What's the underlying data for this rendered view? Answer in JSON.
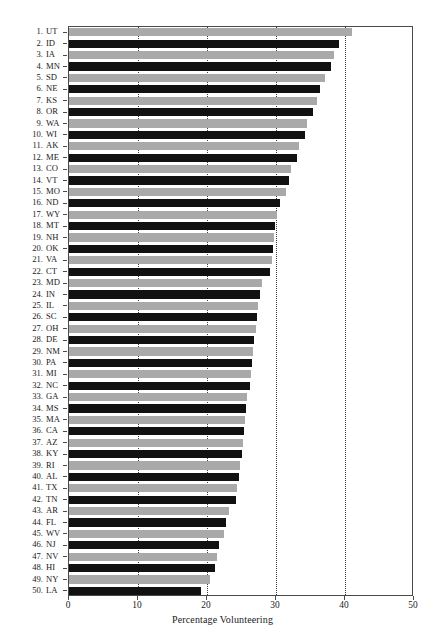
{
  "chart_data": {
    "type": "bar",
    "orientation": "horizontal",
    "title": "",
    "xlabel": "Percentage Volunteering",
    "ylabel": "",
    "xlim": [
      0,
      50
    ],
    "ylim": [
      0,
      50
    ],
    "xticks": [
      0,
      10,
      20,
      30,
      40,
      50
    ],
    "xticklabels": [
      "0",
      "10",
      "20",
      "30",
      "40",
      "50"
    ],
    "grid": "vertical dotted gridlines at 10, 20, 30, 40",
    "legend": "none",
    "bar_colors": [
      "#a9a9a9",
      "#111111"
    ],
    "bar_color_pattern": "alternating light gray / black by rank",
    "categories": [
      "UT",
      "ID",
      "IA",
      "MN",
      "SD",
      "NE",
      "KS",
      "OR",
      "WA",
      "WI",
      "AK",
      "ME",
      "CO",
      "VT",
      "MO",
      "ND",
      "WY",
      "MT",
      "NH",
      "OK",
      "VA",
      "CT",
      "MD",
      "IN",
      "IL",
      "SC",
      "OH",
      "DE",
      "NM",
      "PA",
      "MI",
      "NC",
      "GA",
      "MS",
      "MA",
      "CA",
      "AZ",
      "KY",
      "RI",
      "AL",
      "TX",
      "TN",
      "AR",
      "FL",
      "WV",
      "NJ",
      "NV",
      "HI",
      "NY",
      "LA"
    ],
    "ranks": [
      1,
      2,
      3,
      4,
      5,
      6,
      7,
      8,
      9,
      10,
      11,
      12,
      13,
      14,
      15,
      16,
      17,
      18,
      19,
      20,
      21,
      22,
      23,
      24,
      25,
      26,
      27,
      28,
      29,
      30,
      31,
      32,
      33,
      34,
      35,
      36,
      37,
      38,
      39,
      40,
      41,
      42,
      43,
      44,
      45,
      46,
      47,
      48,
      49,
      50
    ],
    "values": [
      41.0,
      39.1,
      38.4,
      38.0,
      37.1,
      36.4,
      36.0,
      35.4,
      34.5,
      34.2,
      33.3,
      33.1,
      32.2,
      31.9,
      31.4,
      30.6,
      30.2,
      29.9,
      29.7,
      29.6,
      29.4,
      29.2,
      28.0,
      27.7,
      27.4,
      27.2,
      27.1,
      26.8,
      26.7,
      26.5,
      26.4,
      26.3,
      25.8,
      25.6,
      25.5,
      25.3,
      25.2,
      25.1,
      24.8,
      24.6,
      24.3,
      24.2,
      23.2,
      22.8,
      22.5,
      21.8,
      21.4,
      21.2,
      20.4,
      19.1
    ],
    "rows": [
      {
        "rank": "1.",
        "abbr": "UT",
        "value": 41.0,
        "color": "light"
      },
      {
        "rank": "2.",
        "abbr": "ID",
        "value": 39.1,
        "color": "dark"
      },
      {
        "rank": "3.",
        "abbr": "IA",
        "value": 38.4,
        "color": "light"
      },
      {
        "rank": "4.",
        "abbr": "MN",
        "value": 38.0,
        "color": "dark"
      },
      {
        "rank": "5.",
        "abbr": "SD",
        "value": 37.1,
        "color": "light"
      },
      {
        "rank": "6.",
        "abbr": "NE",
        "value": 36.4,
        "color": "dark"
      },
      {
        "rank": "7.",
        "abbr": "KS",
        "value": 36.0,
        "color": "light"
      },
      {
        "rank": "8.",
        "abbr": "OR",
        "value": 35.4,
        "color": "dark"
      },
      {
        "rank": "9.",
        "abbr": "WA",
        "value": 34.5,
        "color": "light"
      },
      {
        "rank": "10.",
        "abbr": "WI",
        "value": 34.2,
        "color": "dark"
      },
      {
        "rank": "11.",
        "abbr": "AK",
        "value": 33.3,
        "color": "light"
      },
      {
        "rank": "12.",
        "abbr": "ME",
        "value": 33.1,
        "color": "dark"
      },
      {
        "rank": "13.",
        "abbr": "CO",
        "value": 32.2,
        "color": "light"
      },
      {
        "rank": "14.",
        "abbr": "VT",
        "value": 31.9,
        "color": "dark"
      },
      {
        "rank": "15.",
        "abbr": "MO",
        "value": 31.4,
        "color": "light"
      },
      {
        "rank": "16.",
        "abbr": "ND",
        "value": 30.6,
        "color": "dark"
      },
      {
        "rank": "17.",
        "abbr": "WY",
        "value": 30.2,
        "color": "light"
      },
      {
        "rank": "18.",
        "abbr": "MT",
        "value": 29.9,
        "color": "dark"
      },
      {
        "rank": "19.",
        "abbr": "NH",
        "value": 29.7,
        "color": "light"
      },
      {
        "rank": "20.",
        "abbr": "OK",
        "value": 29.6,
        "color": "dark"
      },
      {
        "rank": "21.",
        "abbr": "VA",
        "value": 29.4,
        "color": "light"
      },
      {
        "rank": "22.",
        "abbr": "CT",
        "value": 29.2,
        "color": "dark"
      },
      {
        "rank": "23.",
        "abbr": "MD",
        "value": 28.0,
        "color": "light"
      },
      {
        "rank": "24.",
        "abbr": "IN",
        "value": 27.7,
        "color": "dark"
      },
      {
        "rank": "25.",
        "abbr": "IL",
        "value": 27.4,
        "color": "light"
      },
      {
        "rank": "26.",
        "abbr": "SC",
        "value": 27.2,
        "color": "dark"
      },
      {
        "rank": "27.",
        "abbr": "OH",
        "value": 27.1,
        "color": "light"
      },
      {
        "rank": "28.",
        "abbr": "DE",
        "value": 26.8,
        "color": "dark"
      },
      {
        "rank": "29.",
        "abbr": "NM",
        "value": 26.7,
        "color": "light"
      },
      {
        "rank": "30.",
        "abbr": "PA",
        "value": 26.5,
        "color": "dark"
      },
      {
        "rank": "31.",
        "abbr": "MI",
        "value": 26.4,
        "color": "light"
      },
      {
        "rank": "32.",
        "abbr": "NC",
        "value": 26.3,
        "color": "dark"
      },
      {
        "rank": "33.",
        "abbr": "GA",
        "value": 25.8,
        "color": "light"
      },
      {
        "rank": "34.",
        "abbr": "MS",
        "value": 25.6,
        "color": "dark"
      },
      {
        "rank": "35.",
        "abbr": "MA",
        "value": 25.5,
        "color": "light"
      },
      {
        "rank": "36.",
        "abbr": "CA",
        "value": 25.3,
        "color": "dark"
      },
      {
        "rank": "37.",
        "abbr": "AZ",
        "value": 25.2,
        "color": "light"
      },
      {
        "rank": "38.",
        "abbr": "KY",
        "value": 25.1,
        "color": "dark"
      },
      {
        "rank": "39.",
        "abbr": "RI",
        "value": 24.8,
        "color": "light"
      },
      {
        "rank": "40.",
        "abbr": "AL",
        "value": 24.6,
        "color": "dark"
      },
      {
        "rank": "41.",
        "abbr": "TX",
        "value": 24.3,
        "color": "light"
      },
      {
        "rank": "42.",
        "abbr": "TN",
        "value": 24.2,
        "color": "dark"
      },
      {
        "rank": "43.",
        "abbr": "AR",
        "value": 23.2,
        "color": "light"
      },
      {
        "rank": "44.",
        "abbr": "FL",
        "value": 22.8,
        "color": "dark"
      },
      {
        "rank": "45.",
        "abbr": "WV",
        "value": 22.5,
        "color": "light"
      },
      {
        "rank": "46.",
        "abbr": "NJ",
        "value": 21.8,
        "color": "dark"
      },
      {
        "rank": "47.",
        "abbr": "NV",
        "value": 21.4,
        "color": "light"
      },
      {
        "rank": "48.",
        "abbr": "HI",
        "value": 21.2,
        "color": "dark"
      },
      {
        "rank": "49.",
        "abbr": "NY",
        "value": 20.4,
        "color": "light"
      },
      {
        "rank": "50.",
        "abbr": "LA",
        "value": 19.1,
        "color": "dark"
      }
    ]
  }
}
